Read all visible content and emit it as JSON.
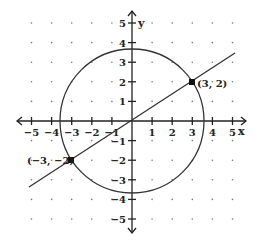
{
  "chart_data": {
    "type": "line",
    "title": "",
    "xlabel": "x",
    "ylabel": "y",
    "xlim": [
      -5,
      5
    ],
    "ylim": [
      -5,
      5
    ],
    "grid": "dots",
    "x_ticks": [
      "-5",
      "-4",
      "-3",
      "-2",
      "-1",
      "1",
      "2",
      "3",
      "4",
      "5"
    ],
    "y_ticks": [
      "5",
      "4",
      "3",
      "2",
      "1",
      "-1",
      "-2",
      "-3",
      "-4",
      "-5"
    ],
    "series": [
      {
        "name": "circle",
        "shape": "circle",
        "center": [
          0,
          0
        ],
        "radius": 3.606,
        "equation": "x^2 + y^2 = 13"
      },
      {
        "name": "line",
        "shape": "line",
        "slope": 0.6667,
        "intercept": 0,
        "equation": "y = (2/3)x",
        "x_range": [
          -5.1,
          5.1
        ]
      }
    ],
    "points": [
      {
        "label": "(3, 2)",
        "x": 3,
        "y": 2
      },
      {
        "label": "(−3, −2)",
        "x": -3,
        "y": -2
      }
    ]
  },
  "labels": {
    "x_axis": "x",
    "y_axis": "y",
    "point_a": "(3, 2)",
    "point_b": "(−3, −2)",
    "x_ticks": [
      "−5",
      "−4",
      "−3",
      "−2",
      "−1",
      "1",
      "2",
      "3",
      "4",
      "5"
    ],
    "y_ticks": [
      "5",
      "4",
      "3",
      "2",
      "1",
      "−1",
      "−2",
      "−3",
      "−4",
      "−5"
    ]
  }
}
